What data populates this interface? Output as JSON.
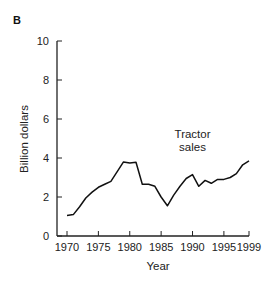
{
  "chart_data": {
    "type": "line",
    "panel_label": "B",
    "title": "",
    "xlabel": "Year",
    "ylabel": "Billion dollars",
    "xlim": [
      1970,
      1999
    ],
    "ylim": [
      0,
      10
    ],
    "x_ticks": [
      1970,
      1975,
      1980,
      1985,
      1990,
      1995,
      1999
    ],
    "x_tick_labels": [
      "1970",
      "1975",
      "1980",
      "1985",
      "1990",
      "1995",
      "1999"
    ],
    "y_ticks": [
      0,
      2,
      4,
      6,
      8,
      10
    ],
    "y_tick_labels": [
      "0",
      "2",
      "4",
      "6",
      "8",
      "10"
    ],
    "grid": false,
    "legend": "none",
    "annotations": [
      {
        "text_lines": [
          "Tractor",
          "sales"
        ],
        "x": 1986.5,
        "y": 4.4
      }
    ],
    "series": [
      {
        "name": "Tractor sales",
        "color": "#111111",
        "x": [
          1970,
          1971,
          1972,
          1973,
          1974,
          1975,
          1976,
          1977,
          1978,
          1979,
          1980,
          1981,
          1982,
          1983,
          1984,
          1985,
          1986,
          1987,
          1988,
          1989,
          1990,
          1991,
          1992,
          1993,
          1994,
          1995,
          1996,
          1997,
          1998,
          1999
        ],
        "values": [
          1.05,
          1.1,
          1.5,
          1.95,
          2.25,
          2.5,
          2.65,
          2.8,
          3.3,
          3.8,
          3.75,
          3.78,
          2.65,
          2.65,
          2.55,
          2.0,
          1.55,
          2.1,
          2.55,
          2.95,
          3.15,
          2.55,
          2.85,
          2.7,
          2.9,
          2.9,
          3.0,
          3.2,
          3.65,
          3.85
        ]
      }
    ]
  }
}
